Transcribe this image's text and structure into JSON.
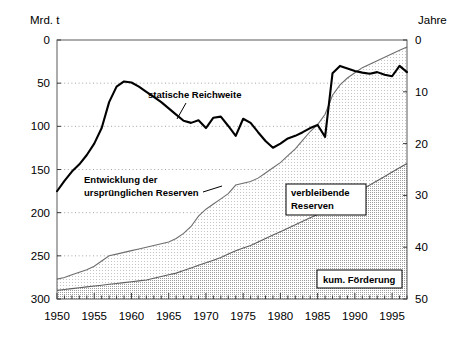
{
  "chart_data": {
    "type": "area",
    "title": "",
    "subtitle": "",
    "xlabel": "",
    "ylabel_left": "Mrd. t",
    "ylabel_right": "Jahre",
    "xlim": [
      1950,
      1997
    ],
    "ylim_left": [
      0,
      300
    ],
    "ylim_right": [
      0,
      50
    ],
    "yticks_left": [
      0,
      50,
      100,
      150,
      200,
      250,
      300
    ],
    "yticks_right": [
      0,
      10,
      20,
      30,
      40,
      50
    ],
    "xticks": [
      1950,
      1955,
      1960,
      1965,
      1970,
      1975,
      1980,
      1985,
      1990,
      1995
    ],
    "xtick_labels": [
      "1950",
      "1955",
      "1960",
      "1965",
      "1970",
      "1975",
      "1980",
      "1985",
      "1990",
      "1995"
    ],
    "grid": "horizontal-dotted",
    "legend_position": "inline-annotations",
    "x": [
      1950,
      1951,
      1952,
      1953,
      1954,
      1955,
      1956,
      1957,
      1958,
      1959,
      1960,
      1961,
      1962,
      1963,
      1964,
      1965,
      1966,
      1967,
      1968,
      1969,
      1970,
      1971,
      1972,
      1973,
      1974,
      1975,
      1976,
      1977,
      1978,
      1979,
      1980,
      1981,
      1982,
      1983,
      1984,
      1985,
      1986,
      1987,
      1988,
      1989,
      1990,
      1991,
      1992,
      1993,
      1994,
      1995,
      1996,
      1997
    ],
    "series": [
      {
        "name": "statische Reichweite",
        "axis": "right",
        "unit": "Jahre",
        "type": "line",
        "color": "#000000",
        "values": [
          20.8,
          22.8,
          24.6,
          26.0,
          27.8,
          30.0,
          33.0,
          38.0,
          41.0,
          42.0,
          41.8,
          41.0,
          40.0,
          39.0,
          38.0,
          36.8,
          35.6,
          34.4,
          34.0,
          34.5,
          33.0,
          35.0,
          35.2,
          33.4,
          31.5,
          34.8,
          34.0,
          32.2,
          30.5,
          29.2,
          30.0,
          31.0,
          31.5,
          32.2,
          33.0,
          33.6,
          31.3,
          43.6,
          45.0,
          44.5,
          44.0,
          43.7,
          43.5,
          43.8,
          43.3,
          43.0,
          45.0,
          43.8
        ]
      },
      {
        "name": "Entwicklung der ursprünglichen Reserven",
        "axis": "left",
        "unit": "Mrd. t",
        "type": "area-boundary",
        "color": "#7a7a7a",
        "values": [
          23,
          25,
          28,
          31,
          34,
          38,
          44,
          50,
          52,
          54,
          56,
          58,
          60,
          62,
          64,
          66,
          70,
          76,
          84,
          96,
          104,
          110,
          116,
          122,
          132,
          134,
          136,
          140,
          146,
          152,
          158,
          166,
          174,
          184,
          194,
          202,
          214,
          236,
          248,
          256,
          262,
          268,
          272,
          276,
          280,
          284,
          288,
          292
        ]
      },
      {
        "name": "kum. Förderung",
        "axis": "left",
        "unit": "Mrd. t",
        "type": "area",
        "color": "#9a9a9a",
        "values": [
          10,
          11,
          12,
          13,
          14,
          15,
          16,
          17,
          18,
          19,
          20,
          21,
          22,
          24,
          26,
          28,
          30,
          33,
          36,
          39,
          42,
          45,
          48,
          52,
          56,
          59,
          62,
          66,
          70,
          74,
          78,
          82,
          86,
          90,
          94,
          98,
          102,
          107,
          112,
          117,
          122,
          127,
          132,
          137,
          142,
          147,
          152,
          157
        ]
      },
      {
        "name": "verbleibende Reserven",
        "axis": "left",
        "unit": "Mrd. t",
        "type": "area-band",
        "color": "#ededed",
        "description": "Fläche zwischen kum. Förderung und ursprünglichen Reserven"
      }
    ],
    "annotations": [
      {
        "text": "statische Reichweite",
        "x": 1966.5,
        "y_right": 45.5,
        "style": "leader-line"
      },
      {
        "text": "Entwicklung der",
        "x": 1955.0,
        "y_left": 137,
        "style": "plain"
      },
      {
        "text": "ursprünglichen Reserven",
        "x": 1955.0,
        "y_left": 124,
        "style": "leader-line"
      },
      {
        "text": "verbleibende",
        "x": 1981.5,
        "y_left": 118,
        "style": "boxed"
      },
      {
        "text": "Reserven",
        "x": 1981.5,
        "y_left": 105,
        "style": "boxed"
      },
      {
        "text": "kum. Förderung",
        "x": 1988.5,
        "y_left": 30,
        "style": "boxed"
      }
    ]
  },
  "labels": {
    "unit_left": "Mrd. t",
    "unit_right": "Jahre",
    "annot_static": "statische Reichweite",
    "annot_entwicklung_1": "Entwicklung der",
    "annot_entwicklung_2": "ursprünglichen Reserven",
    "box_verbleibende_1": "verbleibende",
    "box_verbleibende_2": "Reserven",
    "box_kum": "kum. Förderung"
  },
  "ticks": {
    "left": [
      "300",
      "250",
      "200",
      "150",
      "100",
      "50",
      "0"
    ],
    "right": [
      "50",
      "40",
      "30",
      "20",
      "10",
      "0"
    ],
    "x": [
      "1950",
      "1955",
      "1960",
      "1965",
      "1970",
      "1975",
      "1980",
      "1985",
      "1990",
      "1995"
    ]
  },
  "colors": {
    "line": "#000000",
    "band_remaining": "#efefef",
    "band_cumulative": "#c9c9c9",
    "grid": "#9b9b9b",
    "axis": "#555555",
    "background": "#ffffff"
  }
}
